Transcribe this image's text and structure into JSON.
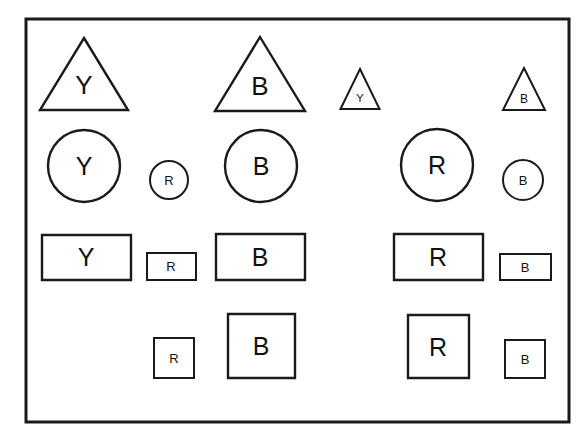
{
  "canvas": {
    "width": 588,
    "height": 448,
    "background_color": "#ffffff",
    "stroke_color": "#1a1a1a",
    "label_color": "#111111",
    "frame": {
      "name": "outer-frame",
      "x": 26,
      "y": 19,
      "width": 543,
      "height": 403,
      "stroke_width": 3
    }
  },
  "shapes": [
    {
      "id": "triangle-large-y",
      "kind": "triangle",
      "size": "large",
      "label": "Y",
      "cx": 84,
      "cy": 74,
      "width": 88,
      "height": 72,
      "label_x": 84,
      "label_y": 85,
      "font_size": 26,
      "stroke_width": 2.4
    },
    {
      "id": "triangle-large-b",
      "kind": "triangle",
      "size": "large",
      "label": "B",
      "cx": 260,
      "cy": 74,
      "width": 90,
      "height": 74,
      "label_x": 260,
      "label_y": 86,
      "font_size": 26,
      "stroke_width": 2.4
    },
    {
      "id": "triangle-small-y",
      "kind": "triangle",
      "size": "small",
      "label": "Y",
      "cx": 360,
      "cy": 89,
      "width": 39,
      "height": 40,
      "label_x": 360,
      "label_y": 98,
      "font_size": 11,
      "stroke_width": 2.0
    },
    {
      "id": "triangle-small-b",
      "kind": "triangle",
      "size": "small",
      "label": "B",
      "cx": 524,
      "cy": 89,
      "width": 42,
      "height": 42,
      "label_x": 524,
      "label_y": 99,
      "font_size": 12,
      "stroke_width": 2.0
    },
    {
      "id": "circle-large-y",
      "kind": "circle",
      "size": "large",
      "label": "Y",
      "cx": 84,
      "cy": 166,
      "r": 36,
      "label_x": 84,
      "label_y": 166,
      "font_size": 25,
      "stroke_width": 2.4
    },
    {
      "id": "circle-small-r",
      "kind": "circle",
      "size": "small",
      "label": "R",
      "cx": 169,
      "cy": 180,
      "r": 19,
      "label_x": 169,
      "label_y": 180,
      "font_size": 13,
      "stroke_width": 2.0
    },
    {
      "id": "circle-large-b",
      "kind": "circle",
      "size": "large",
      "label": "B",
      "cx": 261,
      "cy": 166,
      "r": 36,
      "label_x": 261,
      "label_y": 166,
      "font_size": 25,
      "stroke_width": 2.4
    },
    {
      "id": "circle-large-r",
      "kind": "circle",
      "size": "large",
      "label": "R",
      "cx": 437,
      "cy": 165,
      "r": 36,
      "label_x": 437,
      "label_y": 165,
      "font_size": 25,
      "stroke_width": 2.4
    },
    {
      "id": "circle-small-b",
      "kind": "circle",
      "size": "small",
      "label": "B",
      "cx": 523,
      "cy": 180,
      "r": 20,
      "label_x": 523,
      "label_y": 180,
      "font_size": 13,
      "stroke_width": 2.0
    },
    {
      "id": "rect-large-y",
      "kind": "rect",
      "size": "large",
      "label": "Y",
      "x": 42,
      "y": 235,
      "width": 89,
      "height": 45,
      "label_x": 86,
      "label_y": 257,
      "font_size": 25,
      "stroke_width": 2.4
    },
    {
      "id": "rect-small-r",
      "kind": "rect",
      "size": "small",
      "label": "R",
      "x": 147,
      "y": 253,
      "width": 49,
      "height": 27,
      "label_x": 171,
      "label_y": 266,
      "font_size": 13,
      "stroke_width": 2.0
    },
    {
      "id": "rect-large-b",
      "kind": "rect",
      "size": "large",
      "label": "B",
      "x": 216,
      "y": 234,
      "width": 89,
      "height": 46,
      "label_x": 260,
      "label_y": 257,
      "font_size": 25,
      "stroke_width": 2.4
    },
    {
      "id": "rect-large-r",
      "kind": "rect",
      "size": "large",
      "label": "R",
      "x": 394,
      "y": 234,
      "width": 89,
      "height": 46,
      "label_x": 438,
      "label_y": 257,
      "font_size": 25,
      "stroke_width": 2.4
    },
    {
      "id": "rect-small-b",
      "kind": "rect",
      "size": "small",
      "label": "B",
      "x": 500,
      "y": 254,
      "width": 51,
      "height": 26,
      "label_x": 525,
      "label_y": 267,
      "font_size": 13,
      "stroke_width": 2.0
    },
    {
      "id": "square-small-r",
      "kind": "square",
      "size": "small",
      "label": "R",
      "x": 154,
      "y": 338,
      "width": 40,
      "height": 40,
      "label_x": 174,
      "label_y": 358,
      "font_size": 13,
      "stroke_width": 2.0
    },
    {
      "id": "square-large-b",
      "kind": "square",
      "size": "large",
      "label": "B",
      "x": 228,
      "y": 314,
      "width": 67,
      "height": 64,
      "label_x": 261,
      "label_y": 346,
      "font_size": 25,
      "stroke_width": 2.4
    },
    {
      "id": "square-large-r",
      "kind": "square",
      "size": "large",
      "label": "R",
      "x": 408,
      "y": 315,
      "width": 61,
      "height": 63,
      "label_x": 438,
      "label_y": 347,
      "font_size": 25,
      "stroke_width": 2.4
    },
    {
      "id": "square-small-b",
      "kind": "square",
      "size": "small",
      "label": "B",
      "x": 505,
      "y": 340,
      "width": 40,
      "height": 38,
      "label_x": 525,
      "label_y": 359,
      "font_size": 13,
      "stroke_width": 2.0
    }
  ]
}
